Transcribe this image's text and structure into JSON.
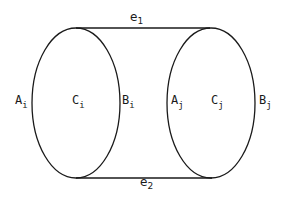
{
  "diagram": {
    "nodes": [
      {
        "id": "left",
        "labels": {
          "left": {
            "main": "A",
            "sub": "i"
          },
          "center": {
            "main": "C",
            "sub": "i"
          },
          "right": {
            "main": "B",
            "sub": "i"
          }
        }
      },
      {
        "id": "right",
        "labels": {
          "left": {
            "main": "A",
            "sub": "j"
          },
          "center": {
            "main": "C",
            "sub": "j"
          },
          "right": {
            "main": "B",
            "sub": "j"
          }
        }
      }
    ],
    "edges": [
      {
        "id": "top",
        "main": "e",
        "sub": "1"
      },
      {
        "id": "bottom",
        "main": "e",
        "sub": "2"
      }
    ],
    "stroke_color": "#1a1a1a",
    "background": "#ffffff"
  }
}
